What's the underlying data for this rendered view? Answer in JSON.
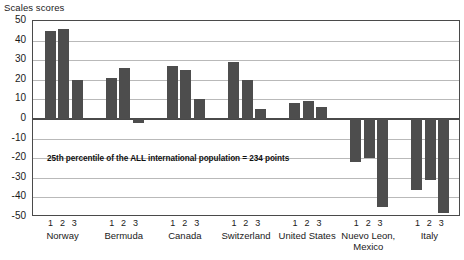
{
  "chart_data": {
    "type": "bar",
    "title": "Scales scores",
    "xlabel": "",
    "ylabel": "Scales scores",
    "ylim": [
      -50,
      50
    ],
    "ytick_values": [
      50,
      40,
      30,
      20,
      10,
      0,
      -10,
      -20,
      -30,
      -40,
      -50
    ],
    "ytick_labels": [
      "50",
      "40",
      "30",
      "20",
      "10",
      "0",
      "-10",
      "-20",
      "-30",
      "-40",
      "-50"
    ],
    "grid": true,
    "legend": "none",
    "series_labels": [
      "1",
      "2",
      "3"
    ],
    "categories": [
      "Norway",
      "Bermuda",
      "Canada",
      "Switzerland",
      "United States",
      "Nuevo Leon, Mexico",
      "Italy"
    ],
    "category_lines": [
      [
        "Norway"
      ],
      [
        "Bermuda"
      ],
      [
        "Canada"
      ],
      [
        "Switzerland"
      ],
      [
        "United States"
      ],
      [
        "Nuevo Leon,",
        "Mexico"
      ],
      [
        "Italy"
      ]
    ],
    "series": [
      {
        "name": "1",
        "values": [
          45,
          21,
          27,
          29,
          8,
          -22,
          -36
        ]
      },
      {
        "name": "2",
        "values": [
          46,
          26,
          25,
          20,
          9,
          -20,
          -31
        ]
      },
      {
        "name": "3",
        "values": [
          20,
          -2,
          10,
          5,
          6,
          -45,
          -48
        ]
      }
    ],
    "annotations": [
      {
        "text": "25th percentile of the ALL international population = 234 points",
        "value": 234
      }
    ],
    "bar_color": "#4d4d4d",
    "grid_color": "#b9b9b9",
    "axis_color": "#4a4a4a"
  }
}
